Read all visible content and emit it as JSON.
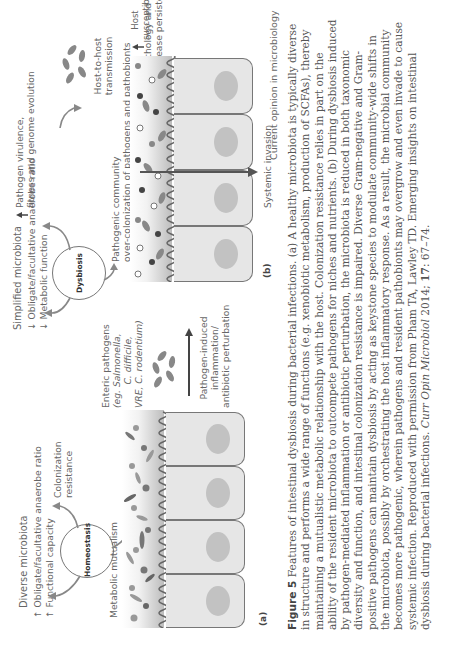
{
  "panel_a": {
    "label": "(a)",
    "headline": "Diverse microbiota",
    "bullets": [
      {
        "arrow": "↑",
        "text": "Obligate/facultative anaerobe ratio"
      },
      {
        "arrow": "↑",
        "text": "Functional capacity"
      }
    ],
    "center": "Homeostasis",
    "colonization": "Colonization resistance",
    "mutualism": "Metabolic mutualism",
    "enteric_title": "Enteric pathogens",
    "enteric_list": [
      "(eg. Salmonella,",
      "C. difficile,",
      "VRE, C. rodentium)"
    ],
    "transition": [
      "Pathogen-induced",
      "inflammation/",
      "antibiotic perturbation"
    ]
  },
  "panel_b": {
    "label": "(b)",
    "headline": "Simplified microbiota",
    "bullets": [
      {
        "arrow": "↓",
        "text": "Obligate/facultative anaerobe ratio"
      },
      {
        "arrow": "↓",
        "text": "Metabolic function"
      }
    ],
    "center": "Dysbiosis",
    "virulence": [
      "Pathogen virulence,",
      "fitness and genome evolution"
    ],
    "transmission": [
      "Host-to-host",
      "transmission"
    ],
    "community": [
      "Pathogenic community",
      "over-colonization of pathogens and pathobionts"
    ],
    "susceptibility": [
      "Host susceptibility,",
      "pathology and",
      "disease persistence"
    ],
    "invasion": "Systemic invasion"
  },
  "source": "Current opinion in microbiology",
  "caption": {
    "figure_label": "Figure 5",
    "text": "Features of intestinal dysbiosis during bacterial infections. (a) A healthy microbiota is typically diverse in structure and performs a wide range of functions (e.g. xenobiotic metabolism, production of SCFAs), thereby maintaining a mutualistic metabolic relationship with the host. Colonization resistance relies in part on the ability of the resident microbiota to outcompete pathogens for niches and nutrients. (b) During dysbiosis induced by pathogen-mediated inflammation or antibiotic perturbation, the microbiota is reduced in both taxonomic diversity and function, and intestinal colonization resistance is impaired. Diverse Gram-negative and Gram-positive pathogens can maintain dysbiosis by acting as keystone species to modulate community-wide shifts in the microbiota, possibly by orchestrating the host inflammatory response. As a result, the microbial community becomes more pathogenic, wherein pathogens and resident pathobionts may overgrow and even invade to cause systemic infection. Reproduced with permission from Pham TA, Lawley TD. Emerging insights on intestinal dysbiosis during bacterial infections.",
    "journal": "Curr Opin Microbiol",
    "citation_year": " 2014; ",
    "volume": "17",
    "pages": ": 67–74."
  }
}
